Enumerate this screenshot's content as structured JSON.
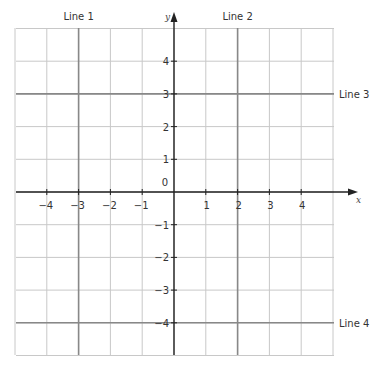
{
  "diagram": {
    "type": "coordinate-grid",
    "x_range": [
      -5,
      5
    ],
    "y_range": [
      -5,
      5
    ],
    "axis_labels": {
      "x": "x",
      "y": "y"
    },
    "origin_label": "0",
    "x_ticks": [
      {
        "v": -4,
        "label": "−4"
      },
      {
        "v": -3,
        "label": "−3"
      },
      {
        "v": -2,
        "label": "−2"
      },
      {
        "v": -1,
        "label": "−1"
      },
      {
        "v": 1,
        "label": "1"
      },
      {
        "v": 2,
        "label": "2"
      },
      {
        "v": 3,
        "label": "3"
      },
      {
        "v": 4,
        "label": "4"
      }
    ],
    "y_ticks": [
      {
        "v": 4,
        "label": "4"
      },
      {
        "v": 3,
        "label": "3"
      },
      {
        "v": 2,
        "label": "2"
      },
      {
        "v": 1,
        "label": "1"
      },
      {
        "v": -1,
        "label": "−1"
      },
      {
        "v": -2,
        "label": "−2"
      },
      {
        "v": -3,
        "label": "−3"
      },
      {
        "v": -4,
        "label": "−4"
      }
    ],
    "lines": [
      {
        "name": "Line 1",
        "orientation": "vertical",
        "value": -3
      },
      {
        "name": "Line 2",
        "orientation": "vertical",
        "value": 2
      },
      {
        "name": "Line 3",
        "orientation": "horizontal",
        "value": 3
      },
      {
        "name": "Line 4",
        "orientation": "horizontal",
        "value": -4
      }
    ],
    "colors": {
      "grid": "#c8c8c8",
      "highlight": "#888888",
      "axis": "#222222"
    }
  }
}
